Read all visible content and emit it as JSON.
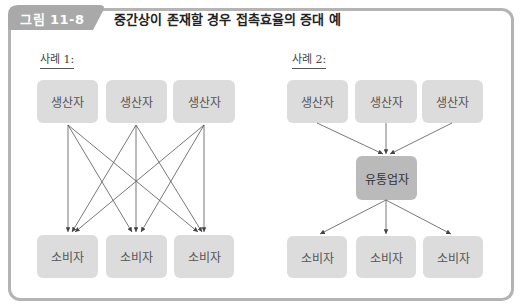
{
  "figure": {
    "label": "그림 11-8",
    "title": "중간상이 존재할 경우 접촉효율의 증대 예"
  },
  "case1": {
    "label": "사례 1:",
    "producers": [
      "생산자",
      "생산자",
      "생산자"
    ],
    "consumers": [
      "소비자",
      "소비자",
      "소비자"
    ],
    "edges": [
      {
        "from": "producer-1",
        "to": "consumer-1"
      },
      {
        "from": "producer-1",
        "to": "consumer-2"
      },
      {
        "from": "producer-1",
        "to": "consumer-3"
      },
      {
        "from": "producer-2",
        "to": "consumer-1"
      },
      {
        "from": "producer-2",
        "to": "consumer-2"
      },
      {
        "from": "producer-2",
        "to": "consumer-3"
      },
      {
        "from": "producer-3",
        "to": "consumer-1"
      },
      {
        "from": "producer-3",
        "to": "consumer-2"
      },
      {
        "from": "producer-3",
        "to": "consumer-3"
      }
    ],
    "contact_count": 9
  },
  "case2": {
    "label": "사례 2:",
    "producers": [
      "생산자",
      "생산자",
      "생산자"
    ],
    "intermediary": "유통업자",
    "consumers": [
      "소비자",
      "소비자",
      "소비자"
    ],
    "edges": [
      {
        "from": "producer-1",
        "to": "intermediary"
      },
      {
        "from": "producer-2",
        "to": "intermediary"
      },
      {
        "from": "producer-3",
        "to": "intermediary"
      },
      {
        "from": "intermediary",
        "to": "consumer-1"
      },
      {
        "from": "intermediary",
        "to": "consumer-2"
      },
      {
        "from": "intermediary",
        "to": "consumer-3"
      }
    ],
    "contact_count": 6
  },
  "colors": {
    "frame": "#b4b4b4",
    "tab": "#a9a9a9",
    "node": "#dcdcdc",
    "intermediary_node": "#bababa",
    "arrow": "#555555"
  }
}
